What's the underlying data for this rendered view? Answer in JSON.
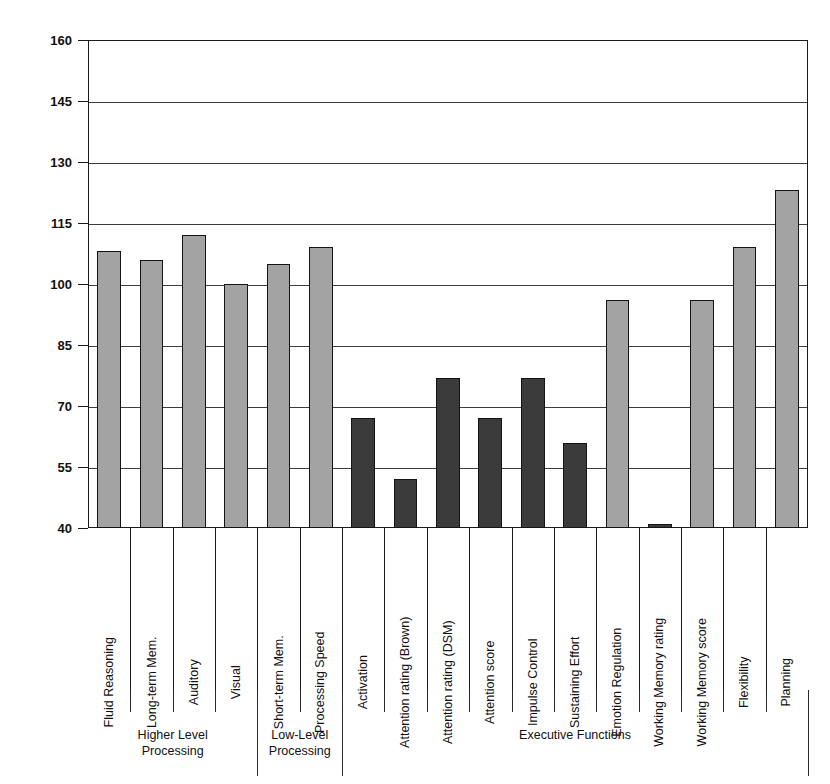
{
  "chart_data": {
    "type": "bar",
    "title": "",
    "xlabel": "",
    "ylabel": "Standard Scores",
    "ylim": [
      40,
      160
    ],
    "yticks": [
      40,
      55,
      70,
      85,
      100,
      115,
      130,
      145,
      160
    ],
    "grid": true,
    "legend": false,
    "categories": [
      "Fluid Reasoning",
      "Long-term Mem.",
      "Auditory",
      "Visual",
      "Short-term Mem.",
      "Processing Speed",
      "Activation",
      "Attention rating (Brown)",
      "Attention rating (DSM)",
      "Attention score",
      "Impulse Control",
      "Sustaining Effort",
      "Emotion Regulation",
      "Working Memory rating",
      "Working Memory score",
      "Flexibility",
      "Planning"
    ],
    "values": [
      108,
      106,
      112,
      100,
      105,
      109,
      67,
      52,
      77,
      67,
      77,
      61,
      96,
      41,
      96,
      109,
      123
    ],
    "bar_shades": [
      "light",
      "light",
      "light",
      "light",
      "light",
      "light",
      "dark",
      "dark",
      "dark",
      "dark",
      "dark",
      "dark",
      "light",
      "dark",
      "light",
      "light",
      "light"
    ],
    "colors": {
      "light_bar": "#a3a3a3",
      "dark_bar": "#3b3b3b",
      "bar_outline": "#141414",
      "gridline": "#3d3d3d",
      "axis": "#1a1a1a",
      "background": "#ffffff"
    },
    "groups": [
      {
        "label": "Higher Level\nProcessing",
        "line1": "Higher Level",
        "line2": "Processing",
        "start": 0,
        "end": 3
      },
      {
        "label": "Low-Level\nProcessing",
        "line1": "Low-Level",
        "line2": "Processing",
        "start": 4,
        "end": 5
      },
      {
        "label": "Executive Functions",
        "line1": "Executive Functions",
        "line2": "",
        "start": 6,
        "end": 16
      }
    ]
  }
}
